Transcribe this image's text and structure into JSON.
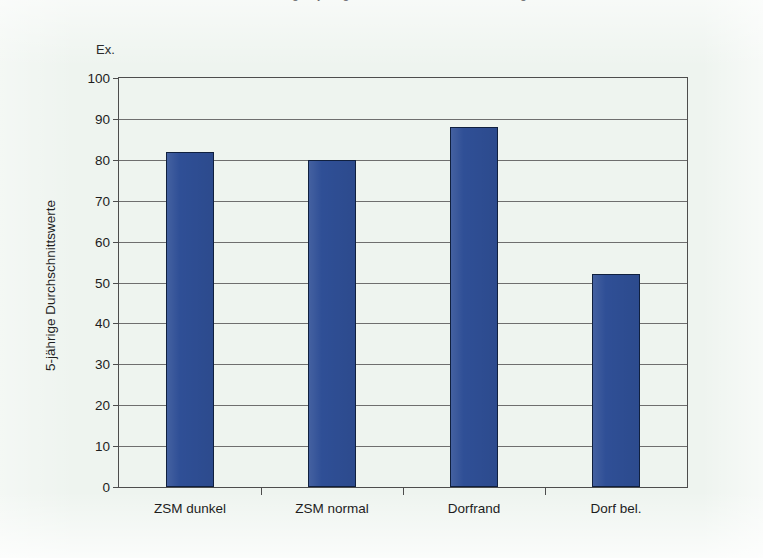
{
  "figure": {
    "background_color": "#eef4ef",
    "top_caption_cropped": "Abbildung: 5-jährige Durchschnittswerte nach Lage",
    "unit_label": "Ex."
  },
  "chart_data": {
    "type": "bar",
    "title": "",
    "subtitle": "",
    "xlabel": "",
    "ylabel": "5-jährige Durchschnittswerte",
    "unit_label": "Ex.",
    "categories": [
      "ZSM dunkel",
      "ZSM normal",
      "Dorfrand",
      "Dorf bel."
    ],
    "values": [
      82,
      80,
      88,
      52
    ],
    "ylim": [
      0,
      100
    ],
    "ytick_labels": [
      "0",
      "10",
      "20",
      "30",
      "40",
      "50",
      "60",
      "70",
      "80",
      "90",
      "100"
    ],
    "ytick_values": [
      0,
      10,
      20,
      30,
      40,
      50,
      60,
      70,
      80,
      90,
      100
    ],
    "grid": true,
    "grid_axis": "y",
    "legend": false,
    "legend_position": "none",
    "bar_color": "#2f4f96",
    "bar_edge_color": "#10203f",
    "axis_color": "#4d4d4d"
  }
}
